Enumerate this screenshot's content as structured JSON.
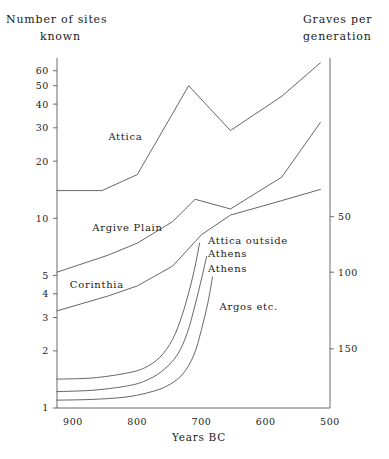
{
  "header": {
    "left_title_line1": "Number of sites",
    "left_title_line2": "known",
    "right_title_line1": "Graves per",
    "right_title_line2": "generation"
  },
  "axes": {
    "xlabel": "Years BC",
    "x_ticks": [
      "900",
      "800",
      "700",
      "600",
      "500"
    ],
    "y_left_ticks": [
      "60",
      "50",
      "40",
      "30",
      "20",
      "10",
      "5",
      "4",
      "3",
      "2",
      "1"
    ],
    "y_right_ticks": [
      "150",
      "100",
      "50"
    ]
  },
  "series_labels": {
    "attica": "Attica",
    "argive_plain": "Argive Plain",
    "corinthia": "Corinthia",
    "attica_outside_athens_l1": "Attica outside",
    "attica_outside_athens_l2": "Athens",
    "athens": "Athens",
    "argos": "Argos etc."
  },
  "chart_data": {
    "type": "line",
    "xlabel": "Years BC",
    "ylabel": "Number of sites known",
    "ylabel_right": "Graves per generation",
    "x_axis": {
      "direction": "reversed",
      "range": [
        925,
        500
      ],
      "ticks": [
        900,
        800,
        700,
        600,
        500
      ]
    },
    "y_axis_left": {
      "scale": "log",
      "range": [
        1,
        70
      ],
      "ticks": [
        1,
        2,
        3,
        4,
        5,
        10,
        20,
        30,
        40,
        50,
        60
      ]
    },
    "y_axis_right": {
      "scale": "log",
      "ticks": [
        50,
        100,
        150
      ],
      "tick_values_on_left_scale": [
        2.05,
        5.2,
        10.2
      ]
    },
    "grid": false,
    "legend": "inline-annotations",
    "series": [
      {
        "name": "Attica",
        "axis": "left",
        "points": [
          {
            "x": 925,
            "y": 14
          },
          {
            "x": 855,
            "y": 14
          },
          {
            "x": 800,
            "y": 17
          },
          {
            "x": 720,
            "y": 50
          },
          {
            "x": 655,
            "y": 29
          },
          {
            "x": 575,
            "y": 44
          },
          {
            "x": 515,
            "y": 66
          }
        ]
      },
      {
        "name": "Argive Plain",
        "axis": "left",
        "points": [
          {
            "x": 925,
            "y": 5.2
          },
          {
            "x": 845,
            "y": 6.4
          },
          {
            "x": 800,
            "y": 7.4
          },
          {
            "x": 745,
            "y": 9.6
          },
          {
            "x": 710,
            "y": 12.6
          },
          {
            "x": 655,
            "y": 11.2
          },
          {
            "x": 575,
            "y": 16.5
          },
          {
            "x": 515,
            "y": 32
          }
        ]
      },
      {
        "name": "Corinthia",
        "axis": "left",
        "points": [
          {
            "x": 925,
            "y": 3.25
          },
          {
            "x": 845,
            "y": 3.9
          },
          {
            "x": 800,
            "y": 4.4
          },
          {
            "x": 745,
            "y": 5.6
          },
          {
            "x": 700,
            "y": 8.2
          },
          {
            "x": 655,
            "y": 10.4
          },
          {
            "x": 575,
            "y": 12.4
          },
          {
            "x": 515,
            "y": 14.2
          }
        ]
      },
      {
        "name": "Attica outside Athens",
        "axis": "right",
        "points": [
          {
            "x": 925,
            "y": 1.42
          },
          {
            "x": 870,
            "y": 1.44
          },
          {
            "x": 820,
            "y": 1.52
          },
          {
            "x": 790,
            "y": 1.62
          },
          {
            "x": 765,
            "y": 1.85
          },
          {
            "x": 745,
            "y": 2.3
          },
          {
            "x": 730,
            "y": 3.1
          },
          {
            "x": 718,
            "y": 4.3
          },
          {
            "x": 710,
            "y": 5.6
          },
          {
            "x": 703,
            "y": 7.4
          }
        ]
      },
      {
        "name": "Athens",
        "axis": "right",
        "points": [
          {
            "x": 925,
            "y": 1.22
          },
          {
            "x": 870,
            "y": 1.24
          },
          {
            "x": 820,
            "y": 1.3
          },
          {
            "x": 790,
            "y": 1.38
          },
          {
            "x": 762,
            "y": 1.56
          },
          {
            "x": 738,
            "y": 1.9
          },
          {
            "x": 722,
            "y": 2.5
          },
          {
            "x": 710,
            "y": 3.5
          },
          {
            "x": 700,
            "y": 4.8
          },
          {
            "x": 692,
            "y": 6.3
          }
        ]
      },
      {
        "name": "Argos etc.",
        "axis": "right",
        "points": [
          {
            "x": 925,
            "y": 1.1
          },
          {
            "x": 870,
            "y": 1.11
          },
          {
            "x": 820,
            "y": 1.14
          },
          {
            "x": 785,
            "y": 1.2
          },
          {
            "x": 755,
            "y": 1.3
          },
          {
            "x": 730,
            "y": 1.5
          },
          {
            "x": 712,
            "y": 1.9
          },
          {
            "x": 700,
            "y": 2.6
          },
          {
            "x": 690,
            "y": 3.6
          },
          {
            "x": 683,
            "y": 4.9
          }
        ]
      }
    ],
    "annotations": [
      {
        "text": "Attica",
        "x": 845,
        "y": 26
      },
      {
        "text": "Argive Plain",
        "x": 870,
        "y": 8.6
      },
      {
        "text": "Corinthia",
        "x": 905,
        "y": 4.3
      },
      {
        "text": "Attica outside Athens",
        "x": 690,
        "y": 7.3
      },
      {
        "text": "Athens",
        "x": 690,
        "y": 5.2
      },
      {
        "text": "Argos etc.",
        "x": 672,
        "y": 3.3
      }
    ]
  }
}
